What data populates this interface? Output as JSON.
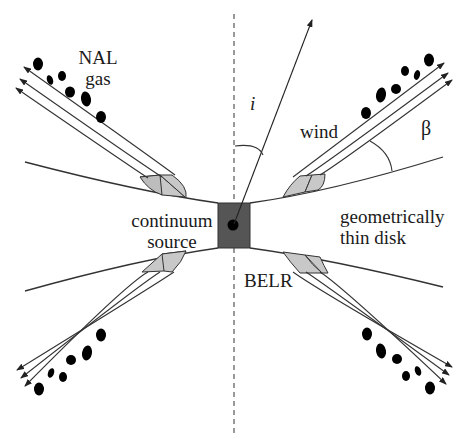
{
  "diagram": {
    "type": "AGN disk-wind geometry schematic",
    "labels": {
      "nal_gas_line1": "NAL",
      "nal_gas_line2": "gas",
      "inclination": "i",
      "wind": "wind",
      "beta": "β",
      "continuum_line1": "continuum",
      "continuum_line2": "source",
      "disk_line1": "geometrically",
      "disk_line2": "thin disk",
      "belr": "BELR"
    },
    "colors": {
      "line": "#333333",
      "central_box": "#555555",
      "belr_shading": "#c8c8c8",
      "clouds": "#000000",
      "axis": "#555555"
    },
    "elements": [
      "dashed rotation axis",
      "line-of-sight arrow with inclination angle i",
      "flared thin accretion disk",
      "central continuum source (dark square with black dot)",
      "four wind streams of three arrows each, inclined at angle beta to the disk",
      "shaded BELR regions at wind bases",
      "NAL gas clouds (black blobs) along outer wind"
    ]
  }
}
